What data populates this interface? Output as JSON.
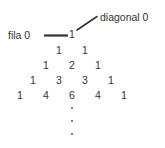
{
  "figure": {
    "kind": "pascals-triangle-diagram",
    "background_color": "#ffffff",
    "text_color": "#333333",
    "line_color": "#333333",
    "annotations": {
      "row_label": "fila 0",
      "diagonal_label": "diagonal 0"
    },
    "rows": [
      {
        "index": 0,
        "values": [
          "1"
        ]
      },
      {
        "index": 1,
        "values": [
          "1",
          "1"
        ]
      },
      {
        "index": 2,
        "values": [
          "1",
          "2",
          "1"
        ]
      },
      {
        "index": 3,
        "values": [
          "1",
          "3",
          "3",
          "1"
        ]
      },
      {
        "index": 4,
        "values": [
          "1",
          "4",
          "6",
          "4",
          "1"
        ]
      }
    ],
    "continuation": {
      "symbol": "vertical-ellipsis",
      "dot_count": 3
    }
  }
}
